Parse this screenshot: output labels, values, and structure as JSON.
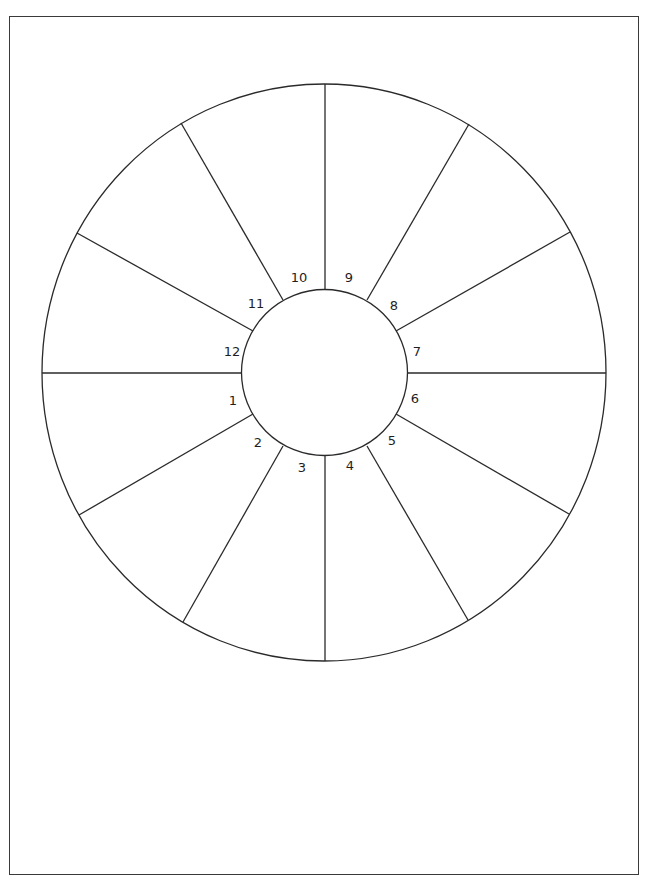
{
  "diagram": {
    "type": "house-wheel",
    "outer_circle": {
      "cx": 324,
      "cy": 372.5,
      "rx": 282,
      "ry": 288.5
    },
    "inner_circle": {
      "cx": 324.5,
      "cy": 372.5,
      "r": 83
    },
    "stroke_color": "#2a2a2a",
    "background_color": "#ffffff",
    "houses": [
      {
        "number": "1",
        "label_x": 233,
        "label_y": 400
      },
      {
        "number": "2",
        "label_x": 258,
        "label_y": 442
      },
      {
        "number": "3",
        "label_x": 302,
        "label_y": 467
      },
      {
        "number": "4",
        "label_x": 350,
        "label_y": 465
      },
      {
        "number": "5",
        "label_x": 392,
        "label_y": 440
      },
      {
        "number": "6",
        "label_x": 415,
        "label_y": 398
      },
      {
        "number": "7",
        "label_x": 417,
        "label_y": 351
      },
      {
        "number": "8",
        "label_x": 394,
        "label_y": 305
      },
      {
        "number": "9",
        "label_x": 349,
        "label_y": 277
      },
      {
        "number": "10",
        "label_x": 299,
        "label_y": 277
      },
      {
        "number": "11",
        "label_x": 256,
        "label_y": 303
      },
      {
        "number": "12",
        "label_x": 232,
        "label_y": 351
      }
    ],
    "spokes": [
      {
        "x1": 42,
        "y1": 373,
        "x2": 242,
        "y2": 373
      },
      {
        "x1": 79,
        "y1": 515,
        "x2": 253,
        "y2": 414
      },
      {
        "x1": 183,
        "y1": 622,
        "x2": 283,
        "y2": 446
      },
      {
        "x1": 325,
        "y1": 661,
        "x2": 325,
        "y2": 456
      },
      {
        "x1": 468,
        "y1": 620,
        "x2": 367,
        "y2": 446
      },
      {
        "x1": 569,
        "y1": 514,
        "x2": 396,
        "y2": 414
      },
      {
        "x1": 606,
        "y1": 373,
        "x2": 407,
        "y2": 373
      },
      {
        "x1": 570,
        "y1": 232,
        "x2": 396,
        "y2": 331
      },
      {
        "x1": 469,
        "y1": 124,
        "x2": 367,
        "y2": 300
      },
      {
        "x1": 325,
        "y1": 84,
        "x2": 325,
        "y2": 289
      },
      {
        "x1": 181,
        "y1": 123,
        "x2": 283,
        "y2": 300
      },
      {
        "x1": 77,
        "y1": 233,
        "x2": 253,
        "y2": 331
      }
    ]
  }
}
